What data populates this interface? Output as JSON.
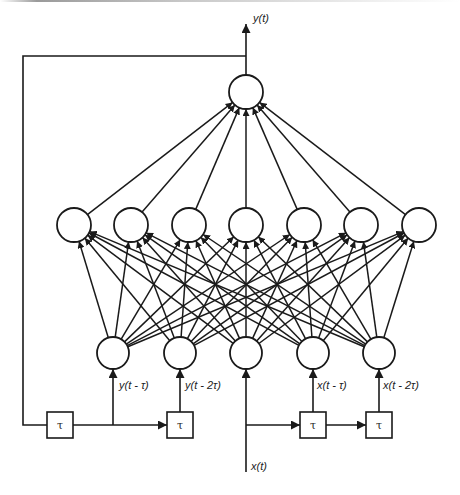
{
  "diagram": {
    "colors": {
      "stroke": "#1a1a1a",
      "node_fill": "#ffffff",
      "background": "#ffffff"
    },
    "output_layer": {
      "nodes": [
        {
          "id": "out",
          "cx": 246,
          "cy": 92,
          "r": 17
        }
      ],
      "label": "y(t)"
    },
    "hidden_layer": {
      "nodes": [
        {
          "id": "h1",
          "cx": 74,
          "cy": 225,
          "r": 17
        },
        {
          "id": "h2",
          "cx": 131,
          "cy": 225,
          "r": 17
        },
        {
          "id": "h3",
          "cx": 189,
          "cy": 225,
          "r": 17
        },
        {
          "id": "h4",
          "cx": 246,
          "cy": 225,
          "r": 17
        },
        {
          "id": "h5",
          "cx": 304,
          "cy": 225,
          "r": 17
        },
        {
          "id": "h6",
          "cx": 361,
          "cy": 225,
          "r": 17
        },
        {
          "id": "h7",
          "cx": 419,
          "cy": 225,
          "r": 17
        }
      ]
    },
    "input_layer": {
      "nodes": [
        {
          "id": "i1",
          "cx": 113,
          "cy": 353,
          "r": 16,
          "label": "y(t - τ)"
        },
        {
          "id": "i2",
          "cx": 180,
          "cy": 353,
          "r": 16,
          "label": "y(t - 2τ)"
        },
        {
          "id": "i3",
          "cx": 246,
          "cy": 353,
          "r": 16,
          "label": ""
        },
        {
          "id": "i4",
          "cx": 313,
          "cy": 353,
          "r": 16,
          "label": "x(t - τ)"
        },
        {
          "id": "i5",
          "cx": 379,
          "cy": 353,
          "r": 16,
          "label": "x(t - 2τ)"
        }
      ]
    },
    "delay_blocks": [
      {
        "id": "d1",
        "x": 47,
        "y": 412,
        "w": 26,
        "h": 26,
        "label": "τ"
      },
      {
        "id": "d2",
        "x": 167,
        "y": 412,
        "w": 26,
        "h": 26,
        "label": "τ"
      },
      {
        "id": "d3",
        "x": 300,
        "y": 412,
        "w": 26,
        "h": 26,
        "label": "τ"
      },
      {
        "id": "d4",
        "x": 366,
        "y": 412,
        "w": 26,
        "h": 26,
        "label": "τ"
      }
    ],
    "labels": {
      "output": "y(t)",
      "input_signal": "x(t)",
      "y_delay_1": "y(t - τ)",
      "y_delay_2": "y(t - 2τ)",
      "x_delay_1": "x(t - τ)",
      "x_delay_2": "x(t - 2τ)",
      "tau": "τ"
    }
  }
}
